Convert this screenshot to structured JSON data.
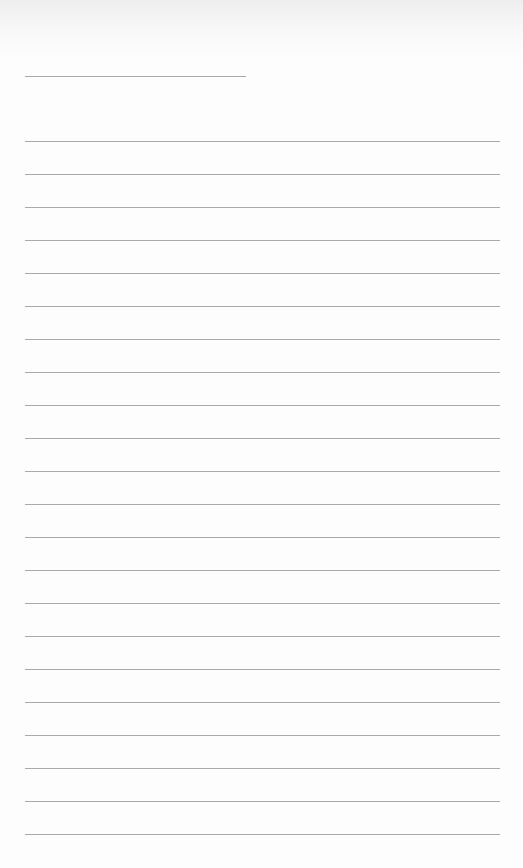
{
  "page": {
    "type": "blank lined writing sheet",
    "background": "#fdfdfd",
    "line_color": "#9a9a9a"
  },
  "header_line": {
    "x": 25,
    "y": 76,
    "width": 221
  },
  "ruled_lines": {
    "x": 25,
    "width": 475,
    "start_y": 141,
    "spacing": 33,
    "count": 22
  }
}
